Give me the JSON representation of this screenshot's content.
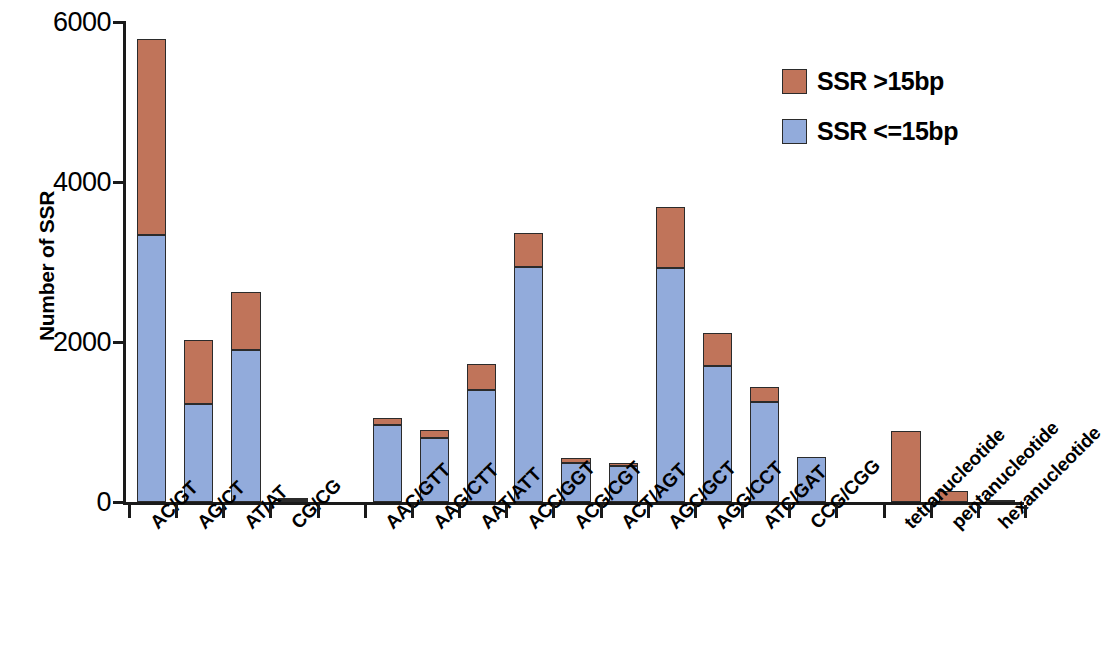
{
  "chart_data": {
    "type": "bar",
    "stacked": true,
    "title": "",
    "xlabel": "",
    "ylabel": "Number of SSR",
    "ylim": [
      0,
      6000
    ],
    "yticks": [
      0,
      2000,
      4000,
      6000
    ],
    "ytick_labels": [
      "0",
      "2000",
      "4000",
      "6000"
    ],
    "grid": false,
    "legend_position": "top-right",
    "categories": [
      "AC/GT",
      "AG/CT",
      "AT/AT",
      "CG/CG",
      "AAC/GTT",
      "AAG/CTT",
      "AAT/ATT",
      "ACC/GGT",
      "ACG/CGT",
      "ACT/AGT",
      "AGC/GCT",
      "AGG/CCT",
      "ATC/GAT",
      "CCG/CGG",
      "tetranucleotide",
      "pentanucleotide",
      "hexanucleotide"
    ],
    "category_gaps_after": [
      3,
      13
    ],
    "series": [
      {
        "name": "SSR <=15bp",
        "color": "#92abdb",
        "values": [
          3340,
          1230,
          1900,
          25,
          960,
          800,
          1400,
          2940,
          490,
          450,
          2930,
          1700,
          1250,
          560,
          0,
          0,
          0
        ]
      },
      {
        "name": "SSR >15bp",
        "color": "#c0745a",
        "values": [
          2450,
          790,
          725,
          5,
          90,
          95,
          320,
          420,
          60,
          35,
          755,
          410,
          190,
          0,
          890,
          140,
          20
        ]
      }
    ],
    "totals": [
      5790,
      2020,
      2625,
      30,
      1050,
      895,
      1720,
      3360,
      550,
      485,
      3685,
      2110,
      1440,
      560,
      890,
      140,
      20
    ]
  },
  "legend": {
    "items": [
      {
        "label": "SSR >15bp",
        "color": "#c0745a"
      },
      {
        "label": "SSR <=15bp",
        "color": "#92abdb"
      }
    ]
  },
  "axis": {
    "y_title": "Number of SSR"
  }
}
